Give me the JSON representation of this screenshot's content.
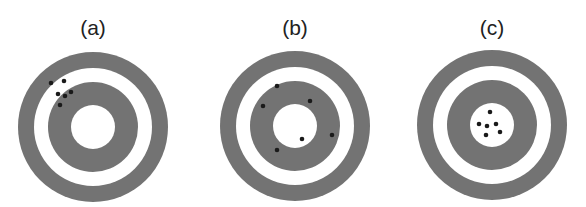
{
  "figure": {
    "colors": {
      "ring": "#737373",
      "background": "#ffffff",
      "shot": "#1a1a1a"
    },
    "ring_radii": [
      75,
      59,
      45,
      22
    ],
    "shot_radius": 2.3,
    "panels": [
      {
        "label": "(a)",
        "center": [
          93,
          127
        ],
        "shots": [
          [
            51,
            83
          ],
          [
            64,
            81
          ],
          [
            58,
            94
          ],
          [
            71,
            92
          ],
          [
            65,
            96
          ],
          [
            60,
            105
          ]
        ]
      },
      {
        "label": "(b)",
        "center": [
          295,
          126
        ],
        "shots": [
          [
            277,
            86
          ],
          [
            263,
            106
          ],
          [
            310,
            101
          ],
          [
            332,
            135
          ],
          [
            302,
            139
          ],
          [
            277,
            150
          ]
        ]
      },
      {
        "label": "(c)",
        "center": [
          492,
          125
        ],
        "shots": [
          [
            490,
            112
          ],
          [
            479,
            124
          ],
          [
            487,
            126
          ],
          [
            496,
            124
          ],
          [
            500,
            132
          ],
          [
            486,
            135
          ]
        ]
      }
    ]
  }
}
